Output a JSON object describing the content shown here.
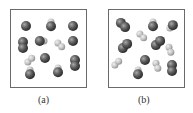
{
  "panels": [
    {
      "label": "(a)",
      "molecules": [
        {
          "type": "atom",
          "x": 26,
          "y": 26,
          "shade": "dark"
        },
        {
          "type": "hetero",
          "x": 51,
          "y": 25,
          "angle": -90
        },
        {
          "type": "atom",
          "x": 73,
          "y": 26,
          "shade": "dark"
        },
        {
          "type": "homo-dark",
          "x": 23,
          "y": 45,
          "angle": 90
        },
        {
          "type": "hetero",
          "x": 41,
          "y": 41,
          "angle": 0
        },
        {
          "type": "homo-light",
          "x": 60,
          "y": 45,
          "angle": 45
        },
        {
          "type": "atom",
          "x": 73,
          "y": 41,
          "shade": "dark"
        },
        {
          "type": "homo-light",
          "x": 30,
          "y": 60,
          "angle": -45
        },
        {
          "type": "atom",
          "x": 45,
          "y": 58,
          "shade": "dark"
        },
        {
          "type": "homo-dark",
          "x": 75,
          "y": 63,
          "angle": 90
        },
        {
          "type": "hetero",
          "x": 30,
          "y": 73,
          "angle": -90
        },
        {
          "type": "hetero",
          "x": 58,
          "y": 71,
          "angle": -90
        }
      ]
    },
    {
      "label": "(b)",
      "molecules": [
        {
          "type": "homo-dark",
          "x": 123,
          "y": 25,
          "angle": 45
        },
        {
          "type": "hetero",
          "x": 153,
          "y": 25,
          "angle": -90
        },
        {
          "type": "hetero",
          "x": 172,
          "y": 26,
          "angle": 135
        },
        {
          "type": "homo-light",
          "x": 142,
          "y": 36,
          "angle": 45
        },
        {
          "type": "homo-dark",
          "x": 125,
          "y": 46,
          "angle": -45
        },
        {
          "type": "homo-dark",
          "x": 158,
          "y": 43,
          "angle": -45
        },
        {
          "type": "homo-light",
          "x": 170,
          "y": 50,
          "angle": 70
        },
        {
          "type": "homo-light",
          "x": 117,
          "y": 63,
          "angle": -45
        },
        {
          "type": "atom",
          "x": 145,
          "y": 60,
          "shade": "dark"
        },
        {
          "type": "homo-light",
          "x": 157,
          "y": 66,
          "angle": 70
        },
        {
          "type": "homo-dark",
          "x": 172,
          "y": 68,
          "angle": 90
        },
        {
          "type": "hetero",
          "x": 138,
          "y": 73,
          "angle": -90
        }
      ]
    }
  ],
  "colors": {
    "dark": "#4a4a4a",
    "light": "#b8b8b8",
    "border": "#6a6a6a"
  }
}
